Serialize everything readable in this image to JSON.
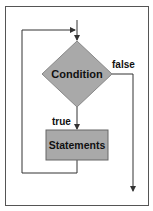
{
  "diagram": {
    "type": "flowchart",
    "nodes": {
      "condition": {
        "label": "Condition",
        "shape": "diamond",
        "fill": "#a9a9a9"
      },
      "statements": {
        "label": "Statements",
        "shape": "rectangle",
        "fill": "#a9a9a9"
      }
    },
    "edges": {
      "true_label": "true",
      "false_label": "false"
    },
    "colors": {
      "frame": "#555555",
      "line": "#333333",
      "text": "#111111"
    }
  }
}
